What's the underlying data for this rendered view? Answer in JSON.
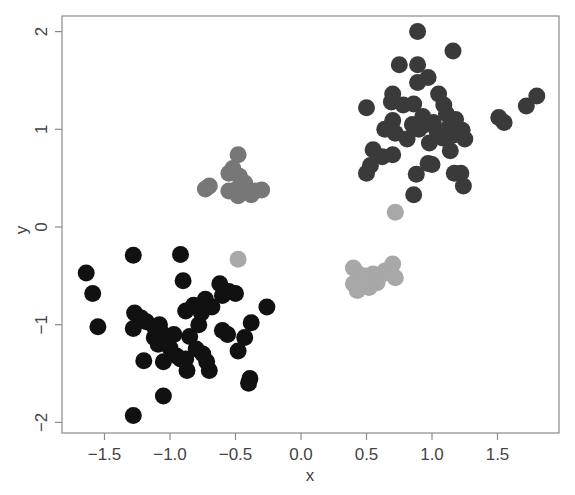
{
  "chart_data": {
    "type": "scatter",
    "title": "",
    "xlabel": "x",
    "ylabel": "y",
    "xlim": [
      -1.82,
      1.97
    ],
    "ylim": [
      -2.11,
      2.16
    ],
    "grid": false,
    "legend": null,
    "x_ticks": [
      -1.5,
      -1.0,
      -0.5,
      0.0,
      0.5,
      1.0,
      1.5
    ],
    "x_tick_labels": [
      "−1.5",
      "−1.0",
      "−0.5",
      "0.0",
      "0.5",
      "1.0",
      "1.5"
    ],
    "y_ticks": [
      -2,
      -1,
      0,
      1,
      2
    ],
    "y_tick_labels": [
      "−2",
      "−1",
      "0",
      "1",
      "2"
    ],
    "point_radius_px": 8.5,
    "series": [
      {
        "name": "cluster-upper-right",
        "color": "#3a3a3a",
        "points": [
          [
            0.89,
            2.0
          ],
          [
            1.16,
            1.8
          ],
          [
            0.75,
            1.66
          ],
          [
            0.89,
            1.66
          ],
          [
            0.97,
            1.53
          ],
          [
            0.7,
            1.36
          ],
          [
            0.89,
            1.48
          ],
          [
            1.05,
            1.36
          ],
          [
            1.09,
            1.25
          ],
          [
            1.11,
            1.16
          ],
          [
            0.5,
            1.22
          ],
          [
            0.69,
            1.28
          ],
          [
            0.78,
            1.25
          ],
          [
            0.86,
            1.26
          ],
          [
            0.95,
            1.05
          ],
          [
            1.01,
            1.07
          ],
          [
            1.04,
            0.98
          ],
          [
            0.9,
            1.0
          ],
          [
            0.93,
            1.13
          ],
          [
            1.13,
            1.02
          ],
          [
            1.16,
            0.94
          ],
          [
            1.23,
            0.99
          ],
          [
            1.18,
            1.1
          ],
          [
            1.25,
            0.9
          ],
          [
            0.98,
            0.86
          ],
          [
            1.08,
            0.91
          ],
          [
            1.14,
            0.78
          ],
          [
            0.69,
            1.02
          ],
          [
            0.7,
            1.09
          ],
          [
            0.72,
            0.96
          ],
          [
            0.55,
            0.79
          ],
          [
            0.62,
            0.72
          ],
          [
            0.53,
            0.63
          ],
          [
            0.5,
            0.55
          ],
          [
            0.7,
            0.74
          ],
          [
            0.97,
            0.65
          ],
          [
            1.0,
            0.64
          ],
          [
            1.17,
            0.55
          ],
          [
            1.22,
            0.55
          ],
          [
            1.24,
            0.42
          ],
          [
            0.88,
            0.54
          ],
          [
            0.86,
            0.33
          ],
          [
            1.51,
            1.12
          ],
          [
            1.55,
            1.07
          ],
          [
            1.72,
            1.24
          ],
          [
            1.8,
            1.34
          ],
          [
            0.64,
            1.0
          ],
          [
            0.81,
            0.9
          ],
          [
            0.85,
            1.05
          ]
        ]
      },
      {
        "name": "cluster-lower-left",
        "color": "#111111",
        "points": [
          [
            -1.64,
            -0.47
          ],
          [
            -1.59,
            -0.68
          ],
          [
            -1.55,
            -1.02
          ],
          [
            -1.28,
            -0.29
          ],
          [
            -0.92,
            -0.28
          ],
          [
            -1.27,
            -0.88
          ],
          [
            -1.22,
            -0.93
          ],
          [
            -1.28,
            -1.04
          ],
          [
            -1.18,
            -0.97
          ],
          [
            -1.12,
            -1.02
          ],
          [
            -1.08,
            -1.0
          ],
          [
            -1.05,
            -1.1
          ],
          [
            -1.09,
            -1.2
          ],
          [
            -1.05,
            -1.38
          ],
          [
            -0.95,
            -1.32
          ],
          [
            -0.88,
            -1.35
          ],
          [
            -0.8,
            -1.25
          ],
          [
            -0.85,
            -1.12
          ],
          [
            -0.78,
            -1.0
          ],
          [
            -0.76,
            -0.88
          ],
          [
            -0.73,
            -0.74
          ],
          [
            -0.82,
            -0.8
          ],
          [
            -0.88,
            -0.86
          ],
          [
            -0.9,
            -0.55
          ],
          [
            -0.62,
            -0.58
          ],
          [
            -0.6,
            -0.7
          ],
          [
            -0.55,
            -0.66
          ],
          [
            -0.68,
            -0.82
          ],
          [
            -0.6,
            -1.06
          ],
          [
            -0.56,
            -1.1
          ],
          [
            -0.5,
            -0.68
          ],
          [
            -0.38,
            -0.98
          ],
          [
            -0.43,
            -1.13
          ],
          [
            -0.48,
            -1.27
          ],
          [
            -0.26,
            -0.82
          ],
          [
            -0.39,
            -1.55
          ],
          [
            -0.4,
            -1.6
          ],
          [
            -0.7,
            -1.47
          ],
          [
            -0.75,
            -1.3
          ],
          [
            -0.72,
            -1.38
          ],
          [
            -0.87,
            -1.47
          ],
          [
            -1.2,
            -1.37
          ],
          [
            -1.05,
            -1.73
          ],
          [
            -1.28,
            -1.93
          ],
          [
            -0.92,
            -1.35
          ],
          [
            -1.0,
            -1.24
          ],
          [
            -0.97,
            -1.1
          ],
          [
            -1.12,
            -1.13
          ]
        ]
      },
      {
        "name": "cluster-upper-middle",
        "color": "#777777",
        "points": [
          [
            -0.48,
            0.74
          ],
          [
            -0.52,
            0.6
          ],
          [
            -0.55,
            0.55
          ],
          [
            -0.47,
            0.52
          ],
          [
            -0.43,
            0.45
          ],
          [
            -0.41,
            0.38
          ],
          [
            -0.35,
            0.37
          ],
          [
            -0.3,
            0.38
          ],
          [
            -0.38,
            0.33
          ],
          [
            -0.5,
            0.38
          ],
          [
            -0.55,
            0.37
          ],
          [
            -0.45,
            0.4
          ],
          [
            -0.7,
            0.42
          ],
          [
            -0.73,
            0.39
          ],
          [
            -0.48,
            0.32
          ]
        ]
      },
      {
        "name": "cluster-right-middle",
        "color": "#a8a8a8",
        "points": [
          [
            0.4,
            -0.42
          ],
          [
            0.44,
            -0.48
          ],
          [
            0.4,
            -0.58
          ],
          [
            0.43,
            -0.65
          ],
          [
            0.48,
            -0.6
          ],
          [
            0.5,
            -0.5
          ],
          [
            0.55,
            -0.48
          ],
          [
            0.6,
            -0.5
          ],
          [
            0.58,
            -0.57
          ],
          [
            0.52,
            -0.62
          ],
          [
            0.64,
            -0.45
          ],
          [
            0.7,
            -0.38
          ],
          [
            0.72,
            -0.52
          ],
          [
            0.67,
            -0.47
          ],
          [
            0.46,
            -0.55
          ],
          [
            0.72,
            0.15
          ],
          [
            -0.48,
            -0.33
          ]
        ]
      }
    ]
  }
}
